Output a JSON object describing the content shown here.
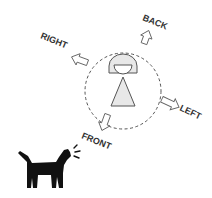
{
  "diagram": {
    "labels": {
      "back": "BACK",
      "right": "RIGHT",
      "left": "LEFT",
      "front": "FRONT"
    },
    "colors": {
      "stroke": "#555555",
      "fill_light": "#e8e8e8",
      "dog": "#111111",
      "text": "#333333"
    }
  }
}
